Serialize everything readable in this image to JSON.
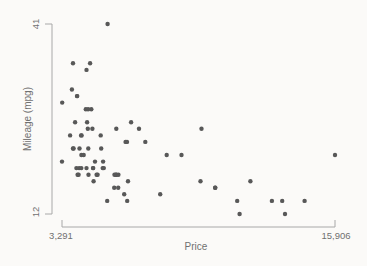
{
  "figure": {
    "background_color": "#fbfaf8",
    "dot_color": "#585858",
    "axis_color": "#a8a8a8",
    "text_color": "#707070"
  },
  "chart_data": {
    "type": "scatter",
    "title": "",
    "xlabel": "Price",
    "ylabel": "Mileage (mpg)",
    "xlim": [
      3291,
      15906
    ],
    "ylim": [
      12,
      41
    ],
    "x_tick_values": [
      3291,
      15906
    ],
    "x_tick_labels": [
      "3,291",
      "15,906"
    ],
    "y_tick_values": [
      12,
      41
    ],
    "y_tick_labels": [
      "12",
      "41"
    ],
    "grid": false,
    "legend": false,
    "marker": "filled-circle",
    "points": [
      [
        4099,
        22
      ],
      [
        4749,
        17
      ],
      [
        3799,
        22
      ],
      [
        4816,
        20
      ],
      [
        7827,
        15
      ],
      [
        5788,
        18
      ],
      [
        4453,
        26
      ],
      [
        5189,
        20
      ],
      [
        10372,
        16
      ],
      [
        4082,
        19
      ],
      [
        11385,
        14
      ],
      [
        14500,
        14
      ],
      [
        15906,
        21
      ],
      [
        3299,
        29
      ],
      [
        5705,
        16
      ],
      [
        4504,
        22
      ],
      [
        5104,
        22
      ],
      [
        3667,
        24
      ],
      [
        3955,
        19
      ],
      [
        3984,
        30
      ],
      [
        4010,
        18
      ],
      [
        5886,
        16
      ],
      [
        6342,
        17
      ],
      [
        4389,
        28
      ],
      [
        4187,
        21
      ],
      [
        11497,
        12
      ],
      [
        13594,
        12
      ],
      [
        13466,
        14
      ],
      [
        3829,
        22
      ],
      [
        5379,
        14
      ],
      [
        6165,
        15
      ],
      [
        4516,
        18
      ],
      [
        6303,
        14
      ],
      [
        3291,
        20
      ],
      [
        8814,
        21
      ],
      [
        4733,
        19
      ],
      [
        5172,
        19
      ],
      [
        4890,
        18
      ],
      [
        4181,
        19
      ],
      [
        4195,
        24
      ],
      [
        10371,
        16
      ],
      [
        4647,
        28
      ],
      [
        4425,
        34
      ],
      [
        4482,
        25
      ],
      [
        6486,
        26
      ],
      [
        4060,
        18
      ],
      [
        5798,
        18
      ],
      [
        4934,
        18
      ],
      [
        5222,
        19
      ],
      [
        4723,
        19
      ],
      [
        4424,
        19
      ],
      [
        4172,
        24
      ],
      [
        9690,
        17
      ],
      [
        6295,
        23
      ],
      [
        9735,
        25
      ],
      [
        6229,
        23
      ],
      [
        4589,
        35
      ],
      [
        5079,
        24
      ],
      [
        8129,
        21
      ],
      [
        4296,
        21
      ],
      [
        5799,
        25
      ],
      [
        4499,
        28
      ],
      [
        3995,
        30
      ],
      [
        12990,
        14
      ],
      [
        3895,
        26
      ],
      [
        3798,
        35
      ],
      [
        5899,
        18
      ],
      [
        3748,
        31
      ],
      [
        5719,
        18
      ],
      [
        7140,
        23
      ],
      [
        5397,
        41
      ],
      [
        4697,
        25
      ],
      [
        6850,
        25
      ],
      [
        11995,
        17
      ]
    ]
  }
}
